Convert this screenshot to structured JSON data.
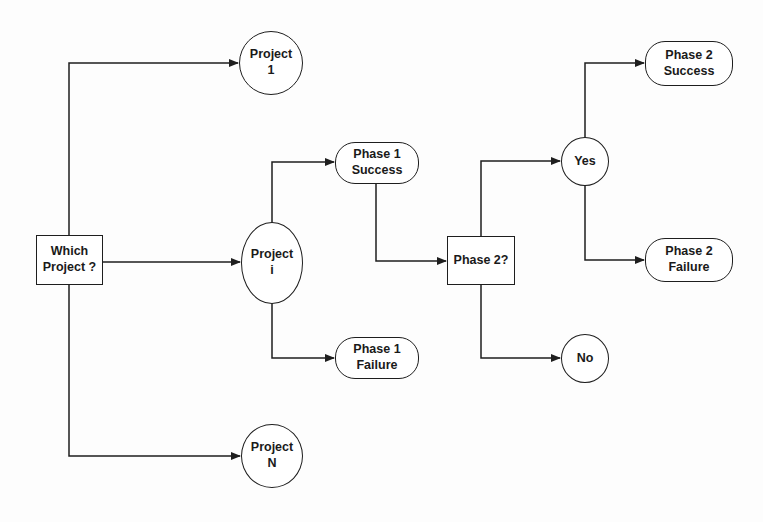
{
  "diagram": {
    "type": "decision-tree",
    "nodes": {
      "which_project": {
        "label": "Which\nProject  ?",
        "shape": "rectangle"
      },
      "project_1": {
        "label": "Project\n1",
        "shape": "circle"
      },
      "project_i": {
        "label": "Project\ni",
        "shape": "circle"
      },
      "project_n": {
        "label": "Project\nN",
        "shape": "circle"
      },
      "phase1_success": {
        "label": "Phase 1\nSuccess",
        "shape": "rounded"
      },
      "phase1_failure": {
        "label": "Phase 1\nFailure",
        "shape": "rounded"
      },
      "phase2_decision": {
        "label": "Phase 2?",
        "shape": "rectangle"
      },
      "yes": {
        "label": "Yes",
        "shape": "circle"
      },
      "no": {
        "label": "No",
        "shape": "circle"
      },
      "phase2_success": {
        "label": "Phase 2\nSuccess",
        "shape": "rounded"
      },
      "phase2_failure": {
        "label": "Phase 2\nFailure",
        "shape": "rounded"
      }
    },
    "edges": [
      {
        "from": "which_project",
        "to": "project_1"
      },
      {
        "from": "which_project",
        "to": "project_i"
      },
      {
        "from": "which_project",
        "to": "project_n"
      },
      {
        "from": "project_i",
        "to": "phase1_success"
      },
      {
        "from": "project_i",
        "to": "phase1_failure"
      },
      {
        "from": "phase1_success",
        "to": "phase2_decision"
      },
      {
        "from": "phase2_decision",
        "to": "yes"
      },
      {
        "from": "phase2_decision",
        "to": "no"
      },
      {
        "from": "yes",
        "to": "phase2_success"
      },
      {
        "from": "yes",
        "to": "phase2_failure"
      }
    ],
    "colors": {
      "stroke": "#1e1e1e",
      "fill": "#ffffff",
      "background": "#fdfdfd"
    }
  }
}
